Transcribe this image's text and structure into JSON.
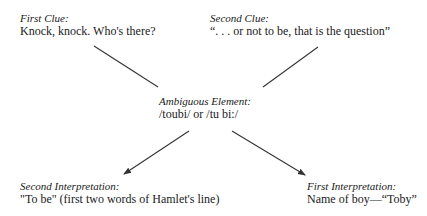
{
  "diagram": {
    "nodes": {
      "first_clue": {
        "label": "First Clue:",
        "text": "Knock, knock. Who's there?"
      },
      "second_clue": {
        "label": "Second Clue:",
        "text": "“. . . or not to be, that is the question”"
      },
      "ambiguous": {
        "label": "Ambiguous Element:",
        "text": "/toubi/ or /tu bi:/"
      },
      "second_interp": {
        "label": "Second Interpretation:",
        "text": "\"To be\" (first two words of Hamlet's line)"
      },
      "first_interp": {
        "label": "First Interpretation:",
        "text": "Name of boy—“Toby”"
      }
    },
    "edges": [
      {
        "from": "first_clue",
        "to": "ambiguous",
        "arrow": false
      },
      {
        "from": "second_clue",
        "to": "ambiguous",
        "arrow": false
      },
      {
        "from": "ambiguous",
        "to": "second_interp",
        "arrow": true
      },
      {
        "from": "ambiguous",
        "to": "first_interp",
        "arrow": true
      }
    ],
    "colors": {
      "line": "#333333",
      "text": "#1a1a1a"
    }
  }
}
